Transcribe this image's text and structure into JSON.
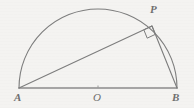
{
  "figure": {
    "background_color": "#f4f3f1",
    "stroke_color": "#7d7d7d",
    "baseline_color": "#8a8a8a",
    "label_color": "#6f6f6f",
    "points": {
      "A": {
        "label": "A",
        "x": 19,
        "y": 88
      },
      "B": {
        "label": "B",
        "x": 177,
        "y": 88
      },
      "O": {
        "label": "O",
        "x": 98,
        "y": 88
      },
      "P": {
        "label": "P",
        "x": 152,
        "y": 26
      }
    },
    "segments": [
      {
        "name": "diameter-AB",
        "from": "A",
        "to": "B"
      },
      {
        "name": "chord-AP",
        "from": "A",
        "to": "P"
      },
      {
        "name": "chord-PB",
        "from": "P",
        "to": "B"
      }
    ],
    "arc": {
      "name": "semicircle-arc",
      "center_x": 98,
      "center_y": 88,
      "radius": 79,
      "start_angle_deg": 180,
      "end_angle_deg": 0
    },
    "right_angle": {
      "name": "right-angle-marker",
      "at_vertex": "P",
      "size": 9,
      "degrees": 90
    },
    "center_tick": {
      "name": "center-tick-mark",
      "x": 98,
      "y": 88
    }
  }
}
